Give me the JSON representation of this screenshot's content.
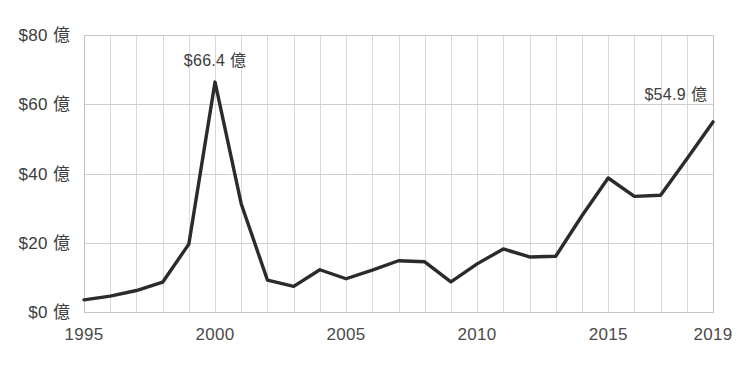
{
  "chart_data": {
    "type": "line",
    "title": "",
    "subtitle": "",
    "xlabel": "",
    "ylabel": "",
    "x": [
      1995,
      1996,
      1997,
      1998,
      1999,
      2000,
      2001,
      2002,
      2003,
      2004,
      2005,
      2006,
      2007,
      2008,
      2009,
      2010,
      2011,
      2012,
      2013,
      2014,
      2015,
      2016,
      2017,
      2018,
      2019
    ],
    "values": [
      3.5,
      4.6,
      6.2,
      8.6,
      19.6,
      66.4,
      31.2,
      9.2,
      7.4,
      12.2,
      9.6,
      12.1,
      14.8,
      14.5,
      8.7,
      13.9,
      18.2,
      15.9,
      16.1,
      27.8,
      38.7,
      33.4,
      33.7,
      44.2,
      54.9
    ],
    "categories": [
      "1995",
      "1996",
      "1997",
      "1998",
      "1999",
      "2000",
      "2001",
      "2002",
      "2003",
      "2004",
      "2005",
      "2006",
      "2007",
      "2008",
      "2009",
      "2010",
      "2011",
      "2012",
      "2013",
      "2014",
      "2015",
      "2016",
      "2017",
      "2018",
      "2019"
    ],
    "series": [
      {
        "name": "",
        "values": [
          3.5,
          4.6,
          6.2,
          8.6,
          19.6,
          66.4,
          31.2,
          9.2,
          7.4,
          12.2,
          9.6,
          12.1,
          14.8,
          14.5,
          8.7,
          13.9,
          18.2,
          15.9,
          16.1,
          27.8,
          38.7,
          33.4,
          33.7,
          44.2,
          54.9
        ],
        "color": "#2b2b2b"
      }
    ],
    "xlim": [
      1995,
      2019
    ],
    "ylim": [
      0,
      80
    ],
    "grid": true,
    "legend": false,
    "legend_position": "none",
    "y_ticks": [
      0,
      20,
      40,
      60,
      80
    ],
    "y_tick_labels": [
      "$0 億",
      "$20 億",
      "$40 億",
      "$60 億",
      "$80 億"
    ],
    "x_ticks": [
      1995,
      2000,
      2005,
      2010,
      2015,
      2019
    ],
    "x_tick_labels": [
      "1995",
      "2000",
      "2005",
      "2010",
      "2015",
      "2019"
    ],
    "annotations": [
      {
        "label": "$66.4 億",
        "x": 2000,
        "y": 66.4,
        "align": "middle"
      },
      {
        "label": "$54.9 億",
        "x": 2019,
        "y": 54.9,
        "align": "end"
      }
    ],
    "colors": {
      "line": "#2b2b2b",
      "grid_vertical": "#d9d9d9",
      "grid_horizontal": "#cfcfcf",
      "frame": "#c4c4c4",
      "text": "#3d3d3d",
      "background": "#ffffff"
    }
  }
}
